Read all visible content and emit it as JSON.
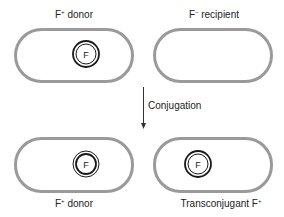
{
  "colors": {
    "cell_outline": "#9a9a9a",
    "plasmid": "#1a1a1a",
    "text": "#222222",
    "arrow": "#333333"
  },
  "cells": [
    {
      "id": "top-left",
      "label_main": "F",
      "label_sup": "+",
      "label_rest": " donor",
      "has_plasmid": true,
      "plasmid_label": "F"
    },
    {
      "id": "top-right",
      "label_main": "F",
      "label_sup": "–",
      "label_rest": " recipient",
      "has_plasmid": false
    },
    {
      "id": "bottom-left",
      "label_main": "F",
      "label_sup": "+",
      "label_rest": " donor",
      "has_plasmid": true,
      "plasmid_label": "F"
    },
    {
      "id": "bottom-right",
      "label_main": "Transconjugant F",
      "label_sup": "+",
      "label_rest": "",
      "has_plasmid": true,
      "plasmid_label": "F"
    }
  ],
  "arrow": {
    "label": "Conjugation"
  }
}
